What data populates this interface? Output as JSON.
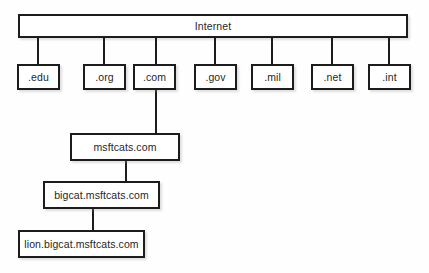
{
  "diagram": {
    "type": "tree",
    "colors": {
      "background": "#fefefe",
      "box_fill": "#ffffff",
      "border": "#1c1c1c",
      "text": "#1f1f1f",
      "shadow": "#969696"
    },
    "root": {
      "label": "Internet",
      "x": 18,
      "y": 14,
      "w": 390,
      "h": 24
    },
    "tld_row": {
      "y": 64,
      "h": 26,
      "w": 43,
      "items": [
        {
          "label": ".edu",
          "x": 17
        },
        {
          "label": ".org",
          "x": 83
        },
        {
          "label": ".com",
          "x": 133
        },
        {
          "label": ".gov",
          "x": 194
        },
        {
          "label": ".mil",
          "x": 251
        },
        {
          "label": ".net",
          "x": 311
        },
        {
          "label": ".int",
          "x": 368
        }
      ]
    },
    "subdomain_chain": [
      {
        "label": "msftcats.com",
        "x": 70,
        "y": 133,
        "w": 110,
        "h": 28
      },
      {
        "label": "bigcat.msftcats.com",
        "x": 43,
        "y": 181,
        "w": 117,
        "h": 28
      },
      {
        "label": "lion.bigcat.msftcats.com",
        "x": 18,
        "y": 230,
        "w": 127,
        "h": 28
      }
    ],
    "connectors": [
      {
        "name": "root-to-edu",
        "x": 37,
        "y": 38,
        "len": 26
      },
      {
        "name": "root-to-org",
        "x": 103,
        "y": 38,
        "len": 26
      },
      {
        "name": "root-to-com",
        "x": 155,
        "y": 38,
        "len": 26
      },
      {
        "name": "root-to-gov",
        "x": 214,
        "y": 38,
        "len": 26
      },
      {
        "name": "root-to-mil",
        "x": 271,
        "y": 38,
        "len": 26
      },
      {
        "name": "root-to-net",
        "x": 331,
        "y": 38,
        "len": 26
      },
      {
        "name": "root-to-int",
        "x": 388,
        "y": 38,
        "len": 26
      },
      {
        "name": "com-to-msftcats",
        "x": 155,
        "y": 90,
        "len": 43
      },
      {
        "name": "msftcats-to-bigcat",
        "x": 125,
        "y": 161,
        "len": 20
      },
      {
        "name": "bigcat-to-lion",
        "x": 92,
        "y": 209,
        "len": 21
      }
    ]
  }
}
